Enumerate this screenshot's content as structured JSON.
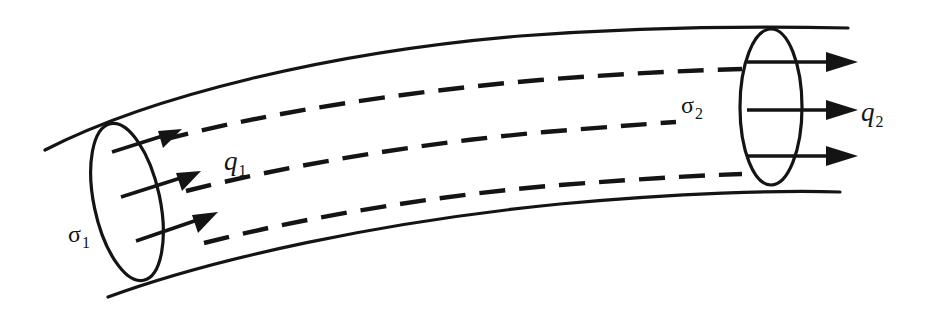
{
  "figure": {
    "type": "line-diagram",
    "background_color": "#ffffff",
    "ink_color": "#141414",
    "width": 925,
    "height": 310
  },
  "labels": {
    "sigma1": {
      "base": "σ",
      "sub": "1",
      "name": "inlet cross-section"
    },
    "q1": {
      "base": "q",
      "sub": "1",
      "name": "inlet flux"
    },
    "sigma2": {
      "base": "σ",
      "sub": "2",
      "name": "outlet cross-section"
    },
    "q2": {
      "base": "q",
      "sub": "2",
      "name": "outlet flux"
    }
  },
  "geometry": {
    "tube_top_edge": "M 45 150 C 150 96, 330 52, 520 36 C 640 27, 760 26, 848 28",
    "tube_bottom_edge": "M 108 297 C 215 258, 380 222, 560 204 C 680 193, 780 190, 840 192",
    "inlet_cap": {
      "cx": 127,
      "cy": 202,
      "rx": 33,
      "ry": 80,
      "rotate": -12
    },
    "outlet_cap": {
      "cx": 771,
      "cy": 107,
      "rx": 31,
      "ry": 78,
      "rotate": 0
    },
    "flow_lines": [
      "M 163 140 C 260 114, 400 92, 540 80 C 630 73, 700 70, 742 69",
      "M 186 191 C 290 165, 420 143, 545 132 C 620 126, 660 123, 676 122",
      "M 204 243 C 310 216, 440 195, 560 185 C 650 178, 710 175, 742 174"
    ],
    "inlet_arrows": [
      {
        "x1": 112,
        "y1": 152,
        "x2": 178,
        "y2": 131
      },
      {
        "x1": 121,
        "y1": 197,
        "x2": 196,
        "y2": 173
      },
      {
        "x1": 136,
        "y1": 241,
        "x2": 213,
        "y2": 214
      }
    ],
    "outlet_arrows": [
      {
        "x1": 747,
        "y1": 62,
        "x2": 858,
        "y2": 62
      },
      {
        "x1": 747,
        "y1": 110,
        "x2": 858,
        "y2": 110
      },
      {
        "x1": 747,
        "y1": 156,
        "x2": 858,
        "y2": 156
      }
    ],
    "dash_pattern": "26 14"
  }
}
